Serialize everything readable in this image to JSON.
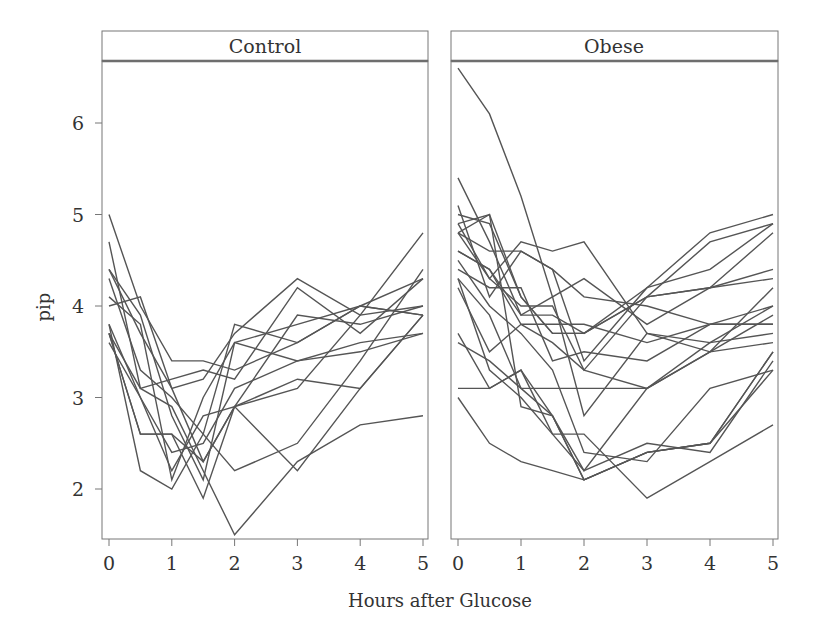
{
  "chart_data": {
    "type": "line",
    "title": "",
    "xlabel": "Hours after Glucose",
    "ylabel": "pip",
    "x": [
      0,
      0.5,
      1,
      1.5,
      2,
      3,
      4,
      5
    ],
    "xticks": [
      0,
      1,
      2,
      3,
      4,
      5
    ],
    "yticks": [
      2,
      3,
      4,
      5,
      6
    ],
    "xlim": [
      -0.1,
      5.15
    ],
    "ylim": [
      1.45,
      6.68
    ],
    "grid": false,
    "legend": "none",
    "line_color": "#555555",
    "panels": [
      {
        "name": "Control",
        "series": [
          {
            "name": "control-1",
            "values": [
              4.3,
              3.3,
              3.0,
              2.6,
              2.2,
              2.5,
              3.4,
              4.4
            ]
          },
          {
            "name": "control-2",
            "values": [
              3.7,
              2.6,
              2.6,
              1.9,
              2.9,
              3.2,
              3.1,
              3.9
            ]
          },
          {
            "name": "control-3",
            "values": [
              4.0,
              4.1,
              3.1,
              2.3,
              2.9,
              3.1,
              3.9,
              4.0
            ]
          },
          {
            "name": "control-4",
            "values": [
              3.6,
              3.0,
              2.2,
              2.8,
              2.9,
              3.9,
              3.8,
              4.0
            ]
          },
          {
            "name": "control-5",
            "values": [
              4.1,
              3.8,
              2.1,
              3.0,
              3.6,
              3.4,
              3.6,
              3.7
            ]
          },
          {
            "name": "control-6",
            "values": [
              3.8,
              2.2,
              2.0,
              2.6,
              3.8,
              3.6,
              4.0,
              3.9
            ]
          },
          {
            "name": "control-7",
            "values": [
              3.8,
              3.0,
              2.4,
              2.5,
              3.1,
              3.4,
              3.5,
              3.7
            ]
          },
          {
            "name": "control-8",
            "values": [
              4.4,
              3.9,
              2.8,
              2.1,
              3.6,
              3.8,
              4.0,
              3.9
            ]
          },
          {
            "name": "control-9",
            "values": [
              5.0,
              4.0,
              3.4,
              3.4,
              3.3,
              3.6,
              4.0,
              4.3
            ]
          },
          {
            "name": "control-10",
            "values": [
              3.7,
              3.1,
              2.9,
              2.2,
              1.5,
              2.3,
              2.7,
              2.8
            ]
          },
          {
            "name": "control-11",
            "values": [
              3.7,
              2.6,
              2.6,
              2.3,
              2.9,
              2.2,
              3.1,
              3.9
            ]
          },
          {
            "name": "control-12",
            "values": [
              4.4,
              3.7,
              3.1,
              3.2,
              3.7,
              4.3,
              3.9,
              4.8
            ]
          },
          {
            "name": "control-13",
            "values": [
              4.7,
              3.1,
              3.2,
              3.3,
              3.2,
              4.2,
              3.7,
              4.3
            ]
          }
        ]
      },
      {
        "name": "Obese",
        "series": [
          {
            "name": "obese-1",
            "values": [
              4.3,
              3.3,
              3.0,
              2.6,
              2.2,
              2.5,
              2.4,
              3.4
            ]
          },
          {
            "name": "obese-2",
            "values": [
              5.0,
              4.9,
              4.1,
              3.7,
              3.7,
              4.1,
              4.7,
              4.9
            ]
          },
          {
            "name": "obese-3",
            "values": [
              4.6,
              4.4,
              3.9,
              3.9,
              3.7,
              4.2,
              4.8,
              5.0
            ]
          },
          {
            "name": "obese-4",
            "values": [
              4.3,
              3.9,
              3.1,
              3.1,
              3.1,
              3.1,
              3.6,
              4.0
            ]
          },
          {
            "name": "obese-5",
            "values": [
              3.1,
              3.1,
              3.3,
              2.6,
              2.6,
              1.9,
              2.3,
              2.7
            ]
          },
          {
            "name": "obese-6",
            "values": [
              4.8,
              5.0,
              2.9,
              2.8,
              2.2,
              3.1,
              3.5,
              3.6
            ]
          },
          {
            "name": "obese-7",
            "values": [
              3.7,
              3.1,
              3.3,
              2.8,
              2.1,
              2.4,
              2.5,
              3.3
            ]
          },
          {
            "name": "obese-8",
            "values": [
              5.4,
              4.7,
              3.9,
              4.1,
              2.8,
              3.7,
              3.5,
              4.2
            ]
          },
          {
            "name": "obese-9",
            "values": [
              3.0,
              2.5,
              2.3,
              2.2,
              2.1,
              2.4,
              2.5,
              3.5
            ]
          },
          {
            "name": "obese-10",
            "values": [
              4.9,
              5.0,
              4.1,
              3.7,
              3.7,
              4.1,
              4.2,
              4.4
            ]
          },
          {
            "name": "obese-11",
            "values": [
              4.8,
              4.3,
              4.7,
              4.6,
              4.7,
              3.7,
              3.6,
              3.7
            ]
          },
          {
            "name": "obese-12",
            "values": [
              4.4,
              4.2,
              4.2,
              3.4,
              3.5,
              3.4,
              3.8,
              4.0
            ]
          },
          {
            "name": "obese-13",
            "values": [
              4.9,
              4.3,
              4.0,
              4.0,
              3.3,
              4.1,
              4.2,
              4.3
            ]
          },
          {
            "name": "obese-14",
            "values": [
              5.1,
              4.1,
              4.6,
              4.4,
              3.4,
              4.2,
              4.4,
              4.9
            ]
          },
          {
            "name": "obese-15",
            "values": [
              4.8,
              4.6,
              4.6,
              4.4,
              4.1,
              4.0,
              3.8,
              3.8
            ]
          },
          {
            "name": "obese-16",
            "values": [
              4.2,
              3.5,
              3.8,
              3.6,
              3.3,
              3.1,
              3.5,
              3.9
            ]
          },
          {
            "name": "obese-17",
            "values": [
              6.6,
              6.1,
              5.2,
              4.1,
              4.3,
              3.8,
              4.2,
              4.8
            ]
          },
          {
            "name": "obese-18",
            "values": [
              3.6,
              3.4,
              3.1,
              2.8,
              2.1,
              2.4,
              2.5,
              3.5
            ]
          },
          {
            "name": "obese-19",
            "values": [
              4.5,
              4.0,
              3.7,
              3.3,
              2.4,
              2.3,
              3.1,
              3.3
            ]
          },
          {
            "name": "obese-20",
            "values": [
              4.6,
              4.4,
              3.8,
              3.8,
              3.8,
              3.6,
              3.8,
              3.8
            ]
          }
        ]
      }
    ]
  },
  "labels": {
    "panel_left": "Control",
    "panel_right": "Obese",
    "xlabel": "Hours after Glucose",
    "ylabel": "pip"
  }
}
